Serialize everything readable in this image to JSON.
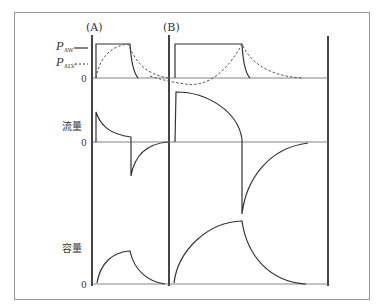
{
  "figure": {
    "panel_labels": {
      "a": "(A)",
      "b": "(B)"
    },
    "pressure": {
      "legend": [
        {
          "symbol": "P",
          "subscript": "AW",
          "style": "solid"
        },
        {
          "symbol": "P",
          "subscript": "ALV",
          "style": "dashed"
        }
      ],
      "zero_label": "0"
    },
    "flow": {
      "label": "流量",
      "zero_label": "0"
    },
    "volume": {
      "label": "容量",
      "zero_label": "0"
    },
    "colors": {
      "frame": "#9a9a9a",
      "axis": "#444444",
      "curve": "#333333"
    }
  }
}
